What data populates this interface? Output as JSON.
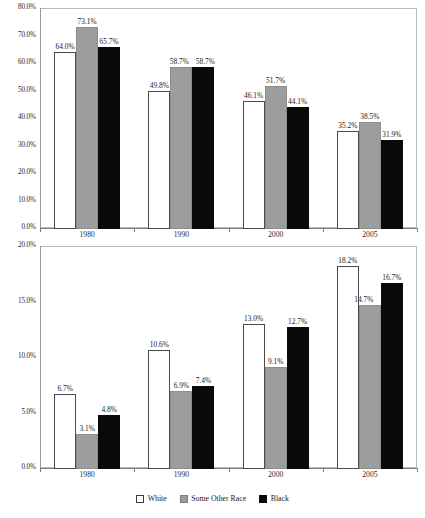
{
  "chart_data": [
    {
      "type": "bar",
      "title": "Did Not Graduate High School",
      "xlabel": "",
      "ylabel": "",
      "ylim": [
        0,
        80
      ],
      "ytick_labels": [
        "80.0%",
        "70.0%",
        "60.0%",
        "50.0%",
        "40.0%",
        "30.0%",
        "20.0%",
        "10.0%",
        "0.0%"
      ],
      "ytick_values": [
        80,
        70,
        60,
        50,
        40,
        30,
        20,
        10,
        0
      ],
      "categories": [
        "1980",
        "1990",
        "2000",
        "2005"
      ],
      "grid": false,
      "legend_position": "bottom",
      "series": [
        {
          "name": "White",
          "values": [
            64.0,
            49.8,
            46.1,
            35.2
          ],
          "labels": [
            "64.0%",
            "49.8%",
            "46.1%",
            "35.2%"
          ],
          "color": "#ffffff"
        },
        {
          "name": "Some Other Race",
          "values": [
            73.1,
            58.7,
            51.7,
            38.5
          ],
          "labels": [
            "73.1%",
            "58.7%",
            "51.7%",
            "38.5%"
          ],
          "color": "#9d9d9d"
        },
        {
          "name": "Black",
          "values": [
            65.7,
            58.7,
            44.1,
            31.9
          ],
          "labels": [
            "65.7%",
            "58.7%",
            "44.1%",
            "31.9%"
          ],
          "color": "#090909"
        }
      ]
    },
    {
      "type": "bar",
      "title": "B.A. Degree or Higher",
      "xlabel": "",
      "ylabel": "",
      "ylim": [
        0,
        20
      ],
      "ytick_labels": [
        "20.0%",
        "15.0%",
        "10.0%",
        "5.0%",
        "0.0%"
      ],
      "ytick_values": [
        20,
        15,
        10,
        5,
        0
      ],
      "categories": [
        "1980",
        "1990",
        "2000",
        "2005"
      ],
      "grid": false,
      "legend_position": "bottom",
      "series": [
        {
          "name": "White",
          "values": [
            6.7,
            10.6,
            13.0,
            18.2
          ],
          "labels": [
            "6.7%",
            "10.6%",
            "13.0%",
            "18.2%"
          ],
          "color": "#ffffff"
        },
        {
          "name": "Some Other Race",
          "values": [
            3.1,
            6.9,
            9.1,
            14.7
          ],
          "labels": [
            "3.1%",
            "6.9%",
            "9.1%",
            "14.7%"
          ],
          "color": "#9d9d9d"
        },
        {
          "name": "Black",
          "values": [
            4.8,
            7.4,
            12.7,
            16.7
          ],
          "labels": [
            "4.8%",
            "7.4%",
            "12.7%",
            "16.7%"
          ],
          "color": "#090909"
        }
      ]
    }
  ],
  "legend": {
    "items": [
      {
        "label": "White",
        "swatch": "white"
      },
      {
        "label": "Some Other Race",
        "swatch": "gray"
      },
      {
        "label": "Black",
        "swatch": "black"
      }
    ]
  }
}
